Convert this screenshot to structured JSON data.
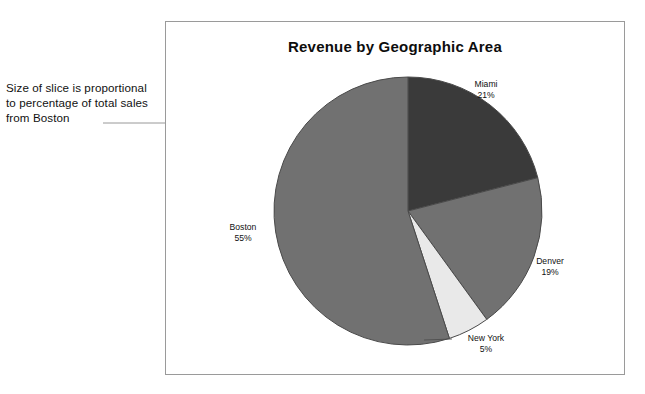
{
  "annotation": {
    "line1": "Size of slice is proportional",
    "line2": "to percentage of total sales",
    "line3": "from Boston"
  },
  "chart_data": {
    "type": "pie",
    "title": "Revenue by Geographic Area",
    "xlabel": "",
    "ylabel": "",
    "unit": "percent",
    "start_angle_deg": 0,
    "direction": "clockwise",
    "legend": "none",
    "grid": false,
    "categories": [
      "Miami",
      "Denver",
      "New York",
      "Boston"
    ],
    "values": [
      21,
      19,
      5,
      55
    ],
    "slices": [
      {
        "label": "Miami",
        "value": 21,
        "value_text": "21%",
        "color": "#3a3a3a"
      },
      {
        "label": "Denver",
        "value": 19,
        "value_text": "19%",
        "color": "#717171"
      },
      {
        "label": "New York",
        "value": 5,
        "value_text": "5%",
        "color": "#e9e9e9"
      },
      {
        "label": "Boston",
        "value": 55,
        "value_text": "55%",
        "color": "#717171"
      }
    ],
    "annotations": [
      {
        "text": "Size of slice is proportional to percentage of total sales from Boston",
        "points_to": "Boston"
      }
    ]
  },
  "colors": {
    "frame_border": "#9a9a9a",
    "slice_outline": "#4a4a4a",
    "leader_line": "#8c8c8c",
    "text": "#111111",
    "background": "#ffffff"
  },
  "labels": {
    "miami": {
      "name": "Miami",
      "pct": "21%"
    },
    "denver": {
      "name": "Denver",
      "pct": "19%"
    },
    "newyork": {
      "name": "New York",
      "pct": "5%"
    },
    "boston": {
      "name": "Boston",
      "pct": "55%"
    }
  }
}
